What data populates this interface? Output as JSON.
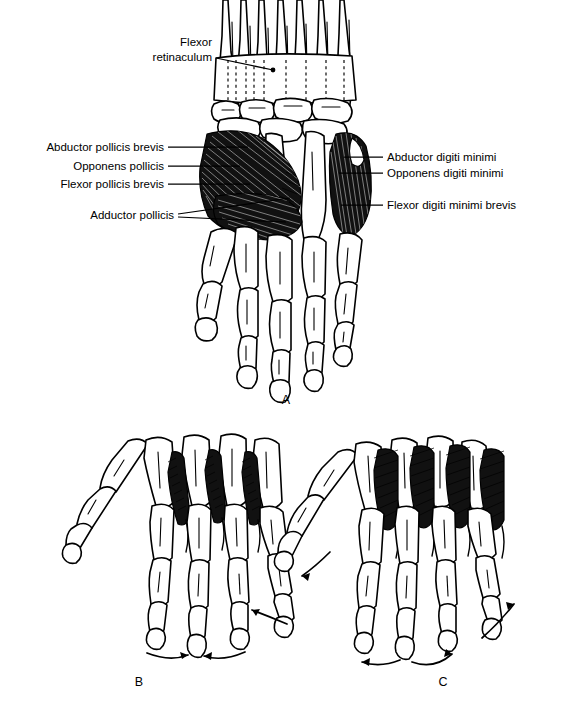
{
  "figure": {
    "background_color": "#ffffff",
    "ink_color": "#000000",
    "muscle_fill": "#111111"
  },
  "panels": [
    {
      "id": "A",
      "letter": "A",
      "caption": "Palmar view of hand skeleton with thenar and hypothenar muscles",
      "letter_x": 286,
      "letter_y": 404
    },
    {
      "id": "B",
      "letter": "B",
      "caption": "Palmar interossei producing adduction of the digits",
      "letter_x": 139,
      "letter_y": 686
    },
    {
      "id": "C",
      "letter": "C",
      "caption": "Dorsal interossei producing abduction of the digits",
      "letter_x": 443,
      "letter_y": 686
    }
  ],
  "labels_left": [
    {
      "id": "flexor-retinaculum",
      "lines": [
        "Flexor",
        "retinaculum"
      ],
      "text_anchor": "end",
      "text_x": 212,
      "text_y": 60,
      "line_height": 15,
      "leader": "M 216 70 L 273 70",
      "endpoint": {
        "cx": 273,
        "cy": 70,
        "r": 2.4
      }
    },
    {
      "id": "abductor-pollicis-brevis",
      "lines": [
        "Abductor pollicis brevis"
      ],
      "text_anchor": "end",
      "text_x": 164,
      "text_y": 151,
      "line_height": 15,
      "leader": "M 168 147 L 248 147",
      "endpoint": null
    },
    {
      "id": "opponens-pollicis",
      "lines": [
        "Opponens pollicis"
      ],
      "text_anchor": "end",
      "text_x": 164,
      "text_y": 170,
      "line_height": 15,
      "leader": "M 168 166 L 240 166",
      "endpoint": null
    },
    {
      "id": "flexor-pollicis-brevis",
      "lines": [
        "Flexor pollicis brevis"
      ],
      "text_anchor": "end",
      "text_x": 164,
      "text_y": 188,
      "line_height": 15,
      "leader": "M 168 184 L 250 184",
      "endpoint": null
    },
    {
      "id": "adductor-pollicis",
      "lines": [
        "Adductor pollicis"
      ],
      "text_anchor": "end",
      "text_x": 174,
      "text_y": 219,
      "line_height": 15,
      "leader": "M 178 214 L 288 199 M 178 216 L 284 220",
      "endpoint": null
    }
  ],
  "labels_right": [
    {
      "id": "abductor-digiti-minimi",
      "lines": [
        "Abductor digiti minimi"
      ],
      "text_anchor": "start",
      "text_x": 387,
      "text_y": 161,
      "line_height": 15,
      "leader": "M 383 157 L 344 157"
    },
    {
      "id": "opponens-digiti-minimi",
      "lines": [
        "Opponens digiti minimi"
      ],
      "text_anchor": "start",
      "text_x": 387,
      "text_y": 177,
      "line_height": 15,
      "leader": "M 383 173 L 339 173"
    },
    {
      "id": "flexor-digiti-minimi-brevis",
      "lines": [
        "Flexor digiti minimi brevis"
      ],
      "text_anchor": "start",
      "text_x": 387,
      "text_y": 209,
      "line_height": 15,
      "leader": "M 383 205 L 341 205"
    }
  ],
  "anatomy_notes": {
    "panel_a_muscle_groups": [
      "thenar eminence",
      "hypothenar eminence",
      "adductor pollicis"
    ],
    "panel_b_muscle_group": "palmar interossei",
    "panel_c_muscle_group": "dorsal interossei",
    "panel_b_arrow_direction": "adduction (toward middle finger)",
    "panel_c_arrow_direction": "abduction (away from middle finger)"
  }
}
